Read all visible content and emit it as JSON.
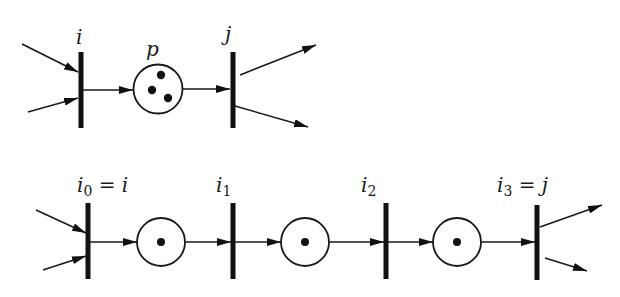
{
  "figure": {
    "colors": {
      "ink": "#111111",
      "background": "#ffffff"
    }
  },
  "top_net": {
    "transitions": [
      {
        "id": "i",
        "label": "i"
      },
      {
        "id": "j",
        "label": "j"
      }
    ],
    "places": [
      {
        "id": "p",
        "label": "p",
        "tokens": 3
      }
    ],
    "arcs": [
      {
        "from": "in-1",
        "to": "i"
      },
      {
        "from": "in-2",
        "to": "i"
      },
      {
        "from": "i",
        "to": "p"
      },
      {
        "from": "p",
        "to": "j"
      },
      {
        "from": "j",
        "to": "out-1"
      },
      {
        "from": "j",
        "to": "out-2"
      }
    ]
  },
  "bottom_net": {
    "transitions": [
      {
        "id": "i0",
        "label_base": "i",
        "label_sub": "0",
        "label_eq": " = ",
        "label_rhs": "i"
      },
      {
        "id": "i1",
        "label_base": "i",
        "label_sub": "1"
      },
      {
        "id": "i2",
        "label_base": "i",
        "label_sub": "2"
      },
      {
        "id": "i3",
        "label_base": "i",
        "label_sub": "3",
        "label_eq": " = ",
        "label_rhs": "j"
      }
    ],
    "places": [
      {
        "id": "q1",
        "tokens": 1
      },
      {
        "id": "q2",
        "tokens": 1
      },
      {
        "id": "q3",
        "tokens": 1
      }
    ],
    "arcs": [
      {
        "from": "in-1",
        "to": "i0"
      },
      {
        "from": "in-2",
        "to": "i0"
      },
      {
        "from": "i0",
        "to": "q1"
      },
      {
        "from": "q1",
        "to": "i1"
      },
      {
        "from": "i1",
        "to": "q2"
      },
      {
        "from": "q2",
        "to": "i2"
      },
      {
        "from": "i2",
        "to": "q3"
      },
      {
        "from": "q3",
        "to": "i3"
      },
      {
        "from": "i3",
        "to": "out-1"
      },
      {
        "from": "i3",
        "to": "out-2"
      }
    ]
  }
}
